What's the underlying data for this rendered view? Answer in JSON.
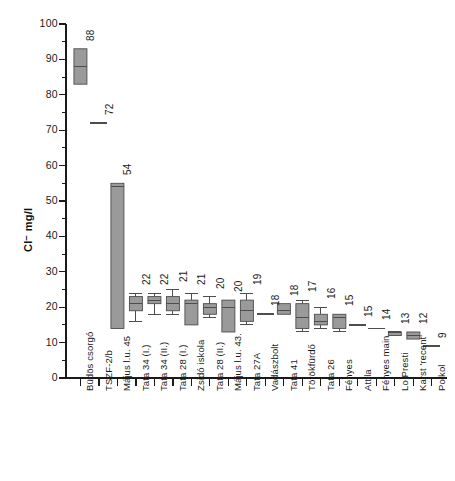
{
  "chart_data": {
    "type": "box",
    "title": "",
    "subtitle": "",
    "xlabel": "",
    "ylabel": "Cl⁻ mg/l",
    "ylim": [
      0,
      100
    ],
    "ytick_step": 10,
    "yminor_step": 5,
    "grid": false,
    "legend": null,
    "ytick_labels": [
      "0",
      "10",
      "20",
      "30",
      "40",
      "50",
      "60",
      "70",
      "80",
      "90",
      "100"
    ],
    "categories": [
      "Büdös csorgó",
      "TSZF-2/b",
      "Május l.u. 45",
      "Tata 34 (I.)",
      "Tata 34 (II.)",
      "Tata 28 (I.)",
      "Zsidó iskola",
      "Tata 28 (II.)",
      "Május l.u. 43.",
      "Tata 27A",
      "Vadászbolt",
      "Tata 41",
      "Törökfürdő",
      "Tata 26",
      "Fényes",
      "Attila",
      "Fényes main",
      "Lo Presti",
      "Karst 'recent'",
      "Polkol"
    ],
    "value_labels": [
      "88",
      "72",
      "54",
      "22",
      "22",
      "21",
      "21",
      "20",
      "20",
      "19",
      "18",
      "18",
      "17",
      "16",
      "15",
      "15",
      "14",
      "13",
      "12",
      "9"
    ],
    "boxes": [
      {
        "category": "Büdös csorgó",
        "label": "88",
        "median": 88,
        "q1": 83,
        "q3": 93,
        "low": 83,
        "high": 93
      },
      {
        "category": "TSZF-2/b",
        "label": "72",
        "median": 72,
        "q1": 72,
        "q3": 72,
        "low": 72,
        "high": 72
      },
      {
        "category": "Május l.u. 45",
        "label": "54",
        "median": 54,
        "q1": 14,
        "q3": 55,
        "low": 14,
        "high": 55
      },
      {
        "category": "Tata 34 (I.)",
        "label": "22",
        "median": 21,
        "q1": 19,
        "q3": 23,
        "low": 16,
        "high": 24
      },
      {
        "category": "Tata 34 (II.)",
        "label": "22",
        "median": 22,
        "q1": 21,
        "q3": 23,
        "low": 18,
        "high": 24
      },
      {
        "category": "Tata 28 (I.)",
        "label": "21",
        "median": 21,
        "q1": 19,
        "q3": 23,
        "low": 18,
        "high": 25
      },
      {
        "category": "Zsidó iskola",
        "label": "21",
        "median": 21,
        "q1": 15,
        "q3": 22,
        "low": 15,
        "high": 24
      },
      {
        "category": "Tata 28 (II.)",
        "label": "20",
        "median": 20,
        "q1": 18,
        "q3": 21,
        "low": 17,
        "high": 23
      },
      {
        "category": "Május l.u. 43.",
        "label": "20",
        "median": 20,
        "q1": 13,
        "q3": 22,
        "low": 13,
        "high": 22
      },
      {
        "category": "Tata 27A",
        "label": "19",
        "median": 19,
        "q1": 16,
        "q3": 22,
        "low": 15,
        "high": 24
      },
      {
        "category": "Vadászbolt",
        "label": "18",
        "median": 18,
        "q1": 18,
        "q3": 18,
        "low": 18,
        "high": 18
      },
      {
        "category": "Tata 41",
        "label": "18",
        "median": 19,
        "q1": 18,
        "q3": 21,
        "low": 18,
        "high": 21
      },
      {
        "category": "Törökfürdő",
        "label": "17",
        "median": 17,
        "q1": 14,
        "q3": 21,
        "low": 13,
        "high": 22
      },
      {
        "category": "Tata 26",
        "label": "16",
        "median": 16,
        "q1": 15,
        "q3": 18,
        "low": 14,
        "high": 20
      },
      {
        "category": "Fényes",
        "label": "15",
        "median": 17,
        "q1": 14,
        "q3": 18,
        "low": 13,
        "high": 18
      },
      {
        "category": "Attila",
        "label": "15",
        "median": 15,
        "q1": 15,
        "q3": 15,
        "low": 15,
        "high": 15
      },
      {
        "category": "Fényes main",
        "label": "14",
        "median": 14,
        "q1": 14,
        "q3": 14,
        "low": 14,
        "high": 14
      },
      {
        "category": "Lo Presti",
        "label": "13",
        "median": 13,
        "q1": 12,
        "q3": 13,
        "low": 12,
        "high": 13
      },
      {
        "category": "Karst 'recent'",
        "label": "12",
        "median": 12,
        "q1": 11,
        "q3": 13,
        "low": 11,
        "high": 13
      },
      {
        "category": "Polkol",
        "label": "9",
        "median": 9,
        "q1": 9,
        "q3": 9,
        "low": 9,
        "high": 9
      }
    ]
  },
  "style": {
    "box_fill": "#9a9a9a",
    "box_stroke": "#4d4d4d",
    "axis_color": "#1a1a1a",
    "background": "#ffffff"
  }
}
